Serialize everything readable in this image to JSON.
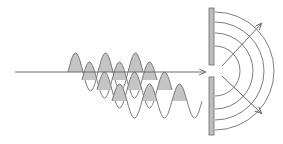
{
  "diagram": {
    "title": "Diffraction of a wave through a single slit",
    "colors": {
      "background": "#ffffff",
      "line": "#6e6e6e",
      "wave_fill": "#c4c4c4",
      "barrier_fill": "#bdbdbd",
      "barrier_stroke": "#6a6a6a"
    },
    "incident_ray": {
      "x1": 15,
      "y1": 72,
      "x2": 205,
      "y2": 72
    },
    "wave_trains": [
      {
        "baseline_y": 72,
        "start_x": 68,
        "wavelength": 30,
        "amplitude": 19,
        "humps": 3
      },
      {
        "baseline_y": 80,
        "start_x": 82,
        "wavelength": 30,
        "amplitude": 18,
        "humps": 3
      },
      {
        "baseline_y": 90,
        "start_x": 97,
        "wavelength": 30,
        "amplitude": 18,
        "humps": 3
      },
      {
        "baseline_y": 101,
        "start_x": 112,
        "wavelength": 30,
        "amplitude": 17,
        "humps": 3,
        "trailing_trough": true
      }
    ],
    "barrier": {
      "x": 209,
      "width": 5,
      "upper": {
        "y_top": 8,
        "y_bottom": 65
      },
      "lower": {
        "y_top": 77,
        "y_bottom": 135
      },
      "slit_center_y": 71
    },
    "wavefronts": {
      "center_x": 215,
      "center_y": 71,
      "radii": [
        25,
        38,
        49,
        59
      ]
    },
    "diffracted_rays": [
      {
        "x1": 222,
        "y1": 66,
        "x2": 261,
        "y2": 24
      },
      {
        "x1": 222,
        "y1": 76,
        "x2": 261,
        "y2": 113
      }
    ]
  }
}
